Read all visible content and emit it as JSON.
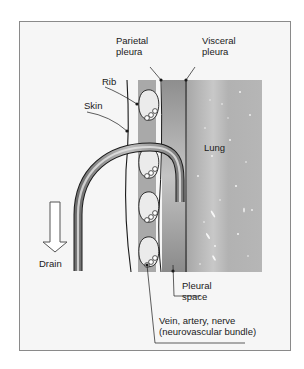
{
  "figure": {
    "labels": {
      "parietal_pleura": [
        "Parietal",
        "pleura"
      ],
      "visceral_pleura": [
        "Visceral",
        "pleura"
      ],
      "rib": "Rib",
      "skin": "Skin",
      "lung": "Lung",
      "drain": "Drain",
      "pleural_space": [
        "Pleural",
        "space"
      ],
      "neurovascular": [
        "Vein, artery, nerve",
        "(neurovascular bundle)"
      ]
    },
    "colors": {
      "frame_bg": "#f6f6f6",
      "frame_border": "#8a8a8a",
      "rib_band": "#a9a9a9",
      "pleural_space": "#9b9b9b",
      "lung": "#b4b4b4",
      "line": "#1a1a1a"
    }
  }
}
